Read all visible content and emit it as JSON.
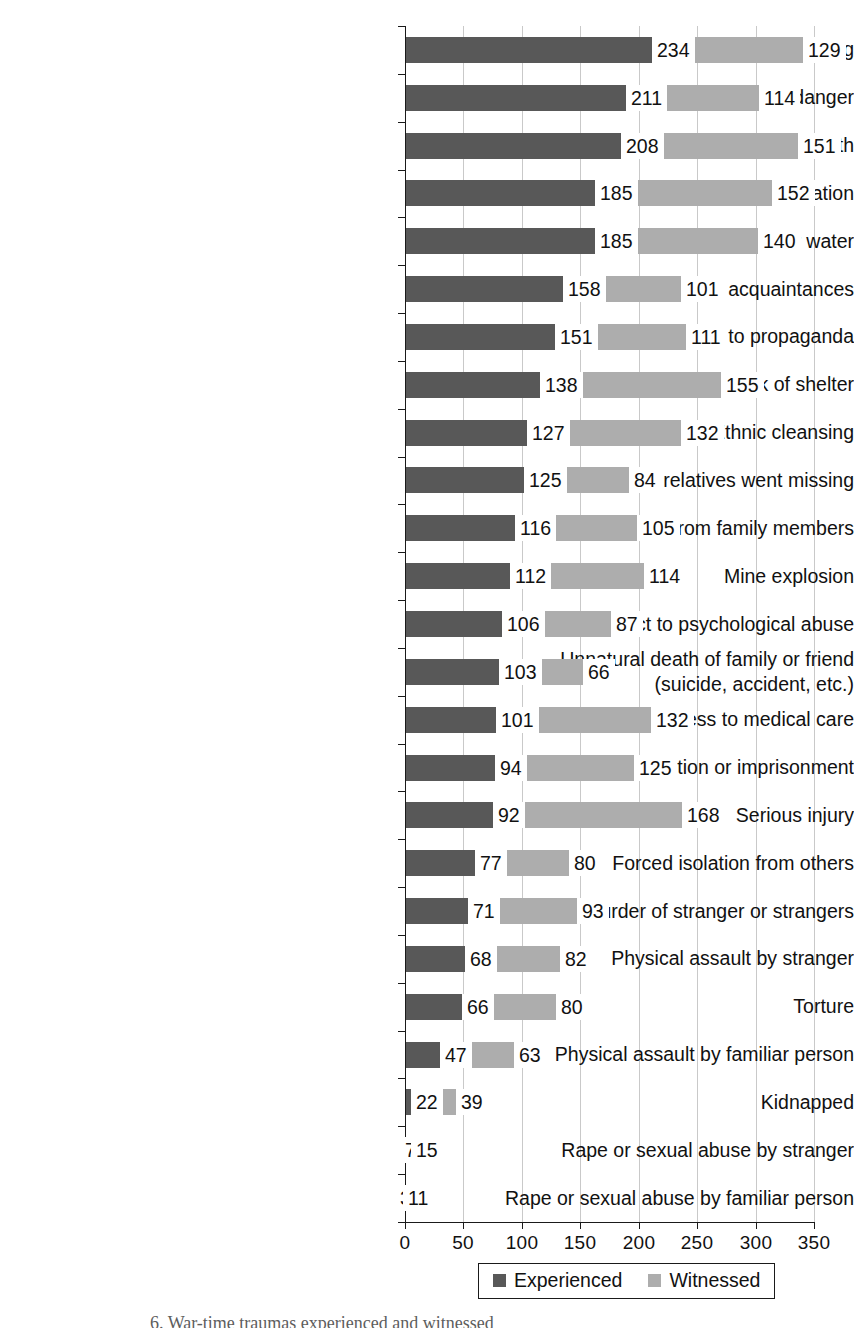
{
  "chart_data": {
    "type": "bar",
    "orientation": "horizontal",
    "stacked": true,
    "title": "",
    "xlabel": "",
    "ylabel": "",
    "xlim": [
      0,
      350
    ],
    "xticks": [
      0,
      50,
      100,
      150,
      200,
      250,
      300,
      350
    ],
    "xticklabels": [
      "0",
      "50",
      "100",
      "150",
      "200",
      "250",
      "300",
      "350"
    ],
    "grid": "vertical",
    "legend_position": "bottom-center",
    "colors": {
      "experienced": "#585858",
      "witnessed": "#adadad",
      "axis": "#1a1a1a",
      "gridline": "#c9c9c9",
      "background": "#ffffff"
    },
    "categories": [
      "Artillery fire or shelling",
      "Frightening situation or life in danger",
      "Being close to death",
      "Combat situation",
      "Lack of food or water",
      "Murder of family or friend or acquaintances",
      "Exposed to propaganda",
      "Lack of shelter",
      "Ethnic cleansing",
      "Family, friends, and relatives went missing",
      "Forced separation from family members",
      "Mine explosion",
      "Subject to psychological abuse",
      "Unnatural death of family or friend\n(suicide, accident, etc.)",
      "Ill health without access to medical care",
      "Detention or imprisonment",
      "Serious injury",
      "Forced isolation from others",
      "Murder of stranger or strangers",
      "Physical assault by stranger",
      "Torture",
      "Physical assault by familiar person",
      "Kidnapped",
      "Rape or sexual abuse by stranger",
      "Rape or sexual abuse by familiar person"
    ],
    "series": [
      {
        "name": "Experienced",
        "color": "#585858",
        "values": [
          234,
          211,
          208,
          185,
          185,
          158,
          151,
          138,
          127,
          125,
          116,
          112,
          106,
          103,
          101,
          94,
          92,
          77,
          71,
          68,
          66,
          47,
          22,
          7,
          3
        ]
      },
      {
        "name": "Witnessed",
        "color": "#adadad",
        "values": [
          129,
          114,
          151,
          152,
          140,
          101,
          111,
          155,
          132,
          84,
          105,
          114,
          87,
          66,
          132,
          125,
          168,
          80,
          93,
          82,
          80,
          63,
          39,
          15,
          11
        ]
      }
    ]
  },
  "legend": {
    "entries": [
      {
        "label": "Experienced",
        "color": "#585858"
      },
      {
        "label": "Witnessed",
        "color": "#adadad"
      }
    ]
  },
  "caption": {
    "text": "6.  War-time traumas experienced and witnessed"
  }
}
